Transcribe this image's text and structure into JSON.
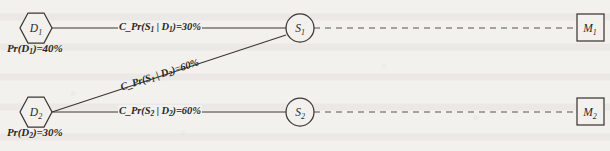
{
  "figure": {
    "type": "bayesian-influence-diagram",
    "background_color": "#f3f1ee",
    "line_color": "#3a3734"
  },
  "nodes": {
    "d1": {
      "label": "D",
      "subscript": "1",
      "shape": "hexagon"
    },
    "d2": {
      "label": "D",
      "subscript": "2",
      "shape": "hexagon"
    },
    "s1": {
      "label": "S",
      "subscript": "1",
      "shape": "circle"
    },
    "s2": {
      "label": "S",
      "subscript": "2",
      "shape": "circle"
    },
    "m1": {
      "label": "M",
      "subscript": "1",
      "shape": "square"
    },
    "m2": {
      "label": "M",
      "subscript": "2",
      "shape": "square"
    }
  },
  "annotations": {
    "d1_prior_prefix": "Pr(D",
    "d1_prior_sub": "1",
    "d1_prior_suffix": ")=40%",
    "d1_prior_full": "Pr(D1)=40%",
    "d1_prior_value": "40%",
    "d2_prior_prefix": "Pr(D",
    "d2_prior_sub": "2",
    "d2_prior_suffix": ")=30%",
    "d2_prior_full": "Pr(D2)=30%",
    "d2_prior_value": "30%"
  },
  "edges": {
    "d1_s1": {
      "from": "d1",
      "to": "s1",
      "style": "solid",
      "label_prefix": "C_Pr(S",
      "label_sub1": "1",
      "label_mid": " | D",
      "label_sub2": "1",
      "label_suffix": ")=30%",
      "label_full": "C_Pr(S1 | D1)=30%",
      "value": "30%"
    },
    "d2_s1": {
      "from": "d2",
      "to": "s1",
      "style": "solid",
      "label_prefix": "C_Pr(S",
      "label_sub1": "1",
      "label_mid": " | D",
      "label_sub2": "2",
      "label_suffix": ")=60%",
      "label_full": "C_Pr(S1 | D2)=60%",
      "value": "60%"
    },
    "d2_s2": {
      "from": "d2",
      "to": "s2",
      "style": "solid",
      "label_prefix": "C_Pr(S",
      "label_sub1": "2",
      "label_mid": " | D",
      "label_sub2": "2",
      "label_suffix": ")=60%",
      "label_full": "C_Pr(S2 | D2)=60%",
      "value": "60%"
    },
    "s1_m1": {
      "from": "s1",
      "to": "m1",
      "style": "dashed",
      "label_full": ""
    },
    "s2_m2": {
      "from": "s2",
      "to": "m2",
      "style": "dashed",
      "label_full": ""
    }
  }
}
